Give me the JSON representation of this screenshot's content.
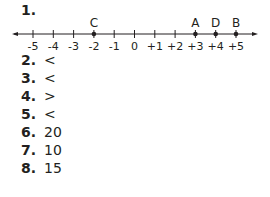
{
  "question1": {
    "label": "1.",
    "number_line": {
      "min": -5,
      "max": 5,
      "ticks": [
        "-5",
        "-4",
        "-3",
        "-2",
        "-1",
        "0",
        "+1",
        "+2",
        "+3",
        "+4",
        "+5"
      ],
      "points": [
        {
          "label": "C",
          "value": -2
        },
        {
          "label": "A",
          "value": 3
        },
        {
          "label": "D",
          "value": 4
        },
        {
          "label": "B",
          "value": 5
        }
      ]
    }
  },
  "answers": [
    {
      "number": "2.",
      "answer": "<"
    },
    {
      "number": "3.",
      "answer": "<"
    },
    {
      "number": "4.",
      "answer": ">"
    },
    {
      "number": "5.",
      "answer": "<"
    },
    {
      "number": "6.",
      "answer": "20"
    },
    {
      "number": "7.",
      "answer": "10"
    },
    {
      "number": "8.",
      "answer": "15"
    }
  ]
}
